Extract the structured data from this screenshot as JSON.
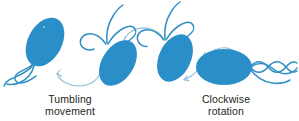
{
  "figure": {
    "background_color": "#ffffff",
    "width": 299,
    "height": 121
  },
  "colors": {
    "cell_fill": "#2a8fc8",
    "flagella_stroke": "#2e8fc4",
    "arrow_stroke": "#8fbcd8",
    "text": "#231f20"
  },
  "captions": {
    "tumbling": {
      "line1": "Tumbling",
      "line2": "movement"
    },
    "clockwise": {
      "line1": "Clockwise",
      "line2": "rotation"
    }
  },
  "cells": [
    {
      "id": "cell-1",
      "label": "bacterium-tilted-left",
      "cx": 45,
      "cy": 42,
      "rx": 17,
      "ry": 26,
      "rotation": 28,
      "flagella_origin": "bottom-left",
      "flagella_count": 3
    },
    {
      "id": "cell-2",
      "label": "bacterium-tilted-mid-left",
      "cx": 118,
      "cy": 63,
      "rx": 16,
      "ry": 25,
      "rotation": 32,
      "flagella_origin": "top-left",
      "flagella_count": 3
    },
    {
      "id": "cell-3",
      "label": "bacterium-tilted-mid-right",
      "cx": 175,
      "cy": 58,
      "rx": 16,
      "ry": 25,
      "rotation": 25,
      "flagella_origin": "top-left",
      "flagella_count": 3
    },
    {
      "id": "cell-4",
      "label": "bacterium-horizontal-bundled",
      "cx": 224,
      "cy": 67,
      "rx": 28,
      "ry": 18,
      "rotation": 0,
      "flagella_origin": "right",
      "flagella_count": 3,
      "flagella_state": "bundled-helix"
    }
  ],
  "arrows": [
    {
      "id": "arrow-1",
      "label": "tumbling-arc-left",
      "direction": "right-to-left",
      "from_cell": "cell-2",
      "to_cell": "cell-1"
    },
    {
      "id": "arrow-2",
      "label": "tumbling-arc-top",
      "direction": "right-to-left",
      "from_cell": "cell-3",
      "to_cell": "cell-2"
    },
    {
      "id": "arrow-3",
      "label": "rotation-arc-lower",
      "direction": "right-to-left",
      "from_cell": "cell-4",
      "to_cell": "cell-3"
    },
    {
      "id": "arrow-4",
      "label": "rotation-arc-top",
      "direction": "right-to-left",
      "from_cell": "cell-4",
      "to_cell": "cell-4"
    }
  ]
}
